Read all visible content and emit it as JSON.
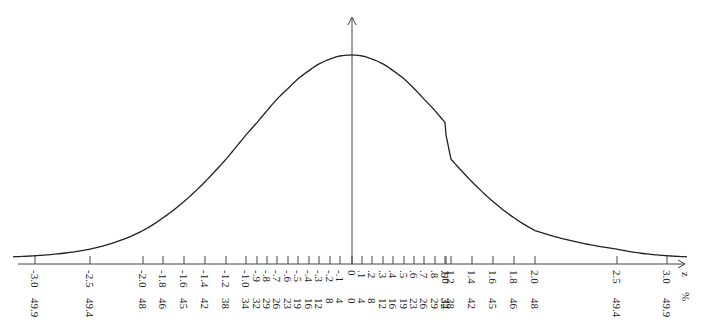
{
  "chart_data": {
    "type": "line",
    "title": "",
    "xlabel": "z",
    "x2label": "%",
    "ylabel": "",
    "grid": false,
    "legend": null,
    "axis_range_z": [
      -3.0,
      3.0
    ],
    "ticks": [
      {
        "z": "-3.0",
        "pct": "49.9",
        "x": 35
      },
      {
        "z": "-2.5",
        "pct": "49.4",
        "x": 90
      },
      {
        "z": "-2.0",
        "pct": "48",
        "x": 143
      },
      {
        "z": "-1.8",
        "pct": "46",
        "x": 163
      },
      {
        "z": "-1.6",
        "pct": "45",
        "x": 184
      },
      {
        "z": "-1.4",
        "pct": "42",
        "x": 205
      },
      {
        "z": "-1.2",
        "pct": "38",
        "x": 226
      },
      {
        "z": "-1.0",
        "pct": "34",
        "x": 246
      },
      {
        "z": "-.9",
        "pct": "32",
        "x": 257
      },
      {
        "z": "-.8",
        "pct": "29",
        "x": 267
      },
      {
        "z": "-.7",
        "pct": "26",
        "x": 277
      },
      {
        "z": "-.6",
        "pct": "23",
        "x": 288
      },
      {
        "z": "-.5",
        "pct": "19",
        "x": 298
      },
      {
        "z": "-.4",
        "pct": "16",
        "x": 309
      },
      {
        "z": "-.3",
        "pct": "12",
        "x": 319
      },
      {
        "z": "-.2",
        "pct": "8",
        "x": 330
      },
      {
        "z": "-.1",
        "pct": "4",
        "x": 340
      },
      {
        "z": "0",
        "pct": "0",
        "x": 352
      },
      {
        "z": ".1",
        "pct": "4",
        "x": 362
      },
      {
        "z": ".2",
        "pct": "8",
        "x": 372
      },
      {
        "z": ".3",
        "pct": "12",
        "x": 383
      },
      {
        "z": ".4",
        "pct": "16",
        "x": 393
      },
      {
        "z": ".5",
        "pct": "19",
        "x": 404
      },
      {
        "z": ".6",
        "pct": "23",
        "x": 414
      },
      {
        "z": ".7",
        "pct": "26",
        "x": 424
      },
      {
        "z": ".8",
        "pct": "29",
        "x": 435
      },
      {
        "z": ".9",
        "pct": "32",
        "x": 445
      },
      {
        "z": "1.0",
        "pct": "34",
        "x": 430
      },
      {
        "z": "1.2",
        "pct": "38",
        "x": 451
      },
      {
        "z": "1.4",
        "pct": "42",
        "x": 472
      },
      {
        "z": "1.6",
        "pct": "45",
        "x": 493
      },
      {
        "z": "1.8",
        "pct": "46",
        "x": 514
      },
      {
        "z": "2.0",
        "pct": "48",
        "x": 535
      },
      {
        "z": "2.5",
        "pct": "49.4",
        "x": 617
      },
      {
        "z": "3.0",
        "pct": "49.9",
        "x": 667
      }
    ]
  },
  "axes": {
    "z_label": "z",
    "pct_label": "%"
  }
}
